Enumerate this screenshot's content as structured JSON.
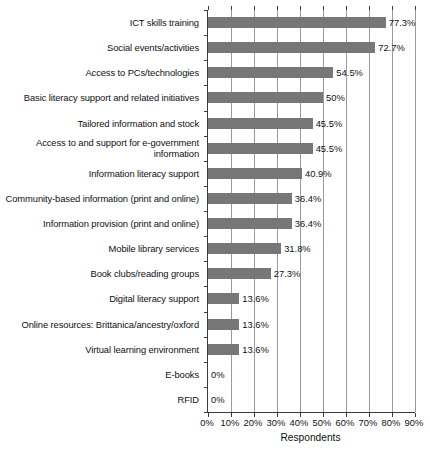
{
  "chart_data": {
    "type": "bar",
    "orientation": "horizontal",
    "title": "",
    "xlabel": "Respondents",
    "ylabel": "",
    "xlim": [
      0,
      90
    ],
    "xticks": [
      "0%",
      "10%",
      "20%",
      "30%",
      "40%",
      "50%",
      "60%",
      "70%",
      "80%",
      "90%"
    ],
    "xtick_values": [
      0,
      10,
      20,
      30,
      40,
      50,
      60,
      70,
      80,
      90
    ],
    "grid": "vertical",
    "legend": "none",
    "bar_color": "#777777",
    "categories": [
      "ICT skills training",
      "Social events/activities",
      "Access to PCs/technologies",
      "Basic literacy support and related initiatives",
      "Tailored information and stock",
      "Access to and support for e-government information",
      "Information literacy support",
      "Community-based information (print and online)",
      "Information provision (print and online)",
      "Mobile library services",
      "Book clubs/reading groups",
      "Digital literacy support",
      "Online resources: Brittanica/ancestry/oxford",
      "Virtual learning environment",
      "E-books",
      "RFID"
    ],
    "values": [
      77.3,
      72.7,
      54.5,
      50,
      45.5,
      45.5,
      40.9,
      36.4,
      36.4,
      31.8,
      27.3,
      13.6,
      13.6,
      13.6,
      0,
      0
    ],
    "value_labels": [
      "77.3%",
      "72.7%",
      "54.5%",
      "50%",
      "45.5%",
      "45.5%",
      "40.9%",
      "36.4%",
      "36.4%",
      "31.8%",
      "27.3%",
      "13.6%",
      "13.6%",
      "13.6%",
      "0%",
      "0%"
    ]
  }
}
